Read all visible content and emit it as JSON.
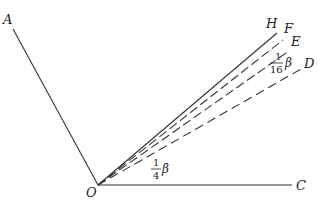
{
  "diagram": {
    "type": "angle-bisection-construction",
    "vertex": {
      "label": "O",
      "x": 98,
      "y": 185
    },
    "rays": [
      {
        "name": "A",
        "label": "A",
        "style": "solid",
        "end": [
          13,
          29
        ],
        "label_pos": [
          3,
          24
        ]
      },
      {
        "name": "C",
        "label": "C",
        "style": "solid",
        "end": [
          292,
          185
        ],
        "label_pos": [
          296,
          190
        ]
      },
      {
        "name": "H",
        "label": "H",
        "style": "solid",
        "end": [
          277,
          33
        ],
        "label_pos": [
          267,
          27
        ]
      },
      {
        "name": "F",
        "label": "F",
        "style": "dashed",
        "end": [
          283,
          40
        ],
        "label_pos": [
          284,
          32
        ]
      },
      {
        "name": "E",
        "label": "E",
        "style": "dashed",
        "end": [
          289,
          51
        ],
        "label_pos": [
          291,
          45
        ]
      },
      {
        "name": "D",
        "label": "D",
        "style": "dashed",
        "end": [
          301,
          69
        ],
        "label_pos": [
          304,
          67
        ]
      }
    ],
    "angle_labels": [
      {
        "name": "quarter-beta",
        "numerator": "1",
        "denominator": "4",
        "symbol": "β",
        "x": 155,
        "y": 170
      },
      {
        "name": "sixteenth-beta",
        "numerator": "1",
        "denominator": "16",
        "symbol": "β",
        "x": 271,
        "y": 61
      }
    ],
    "line_color": "#333333"
  }
}
